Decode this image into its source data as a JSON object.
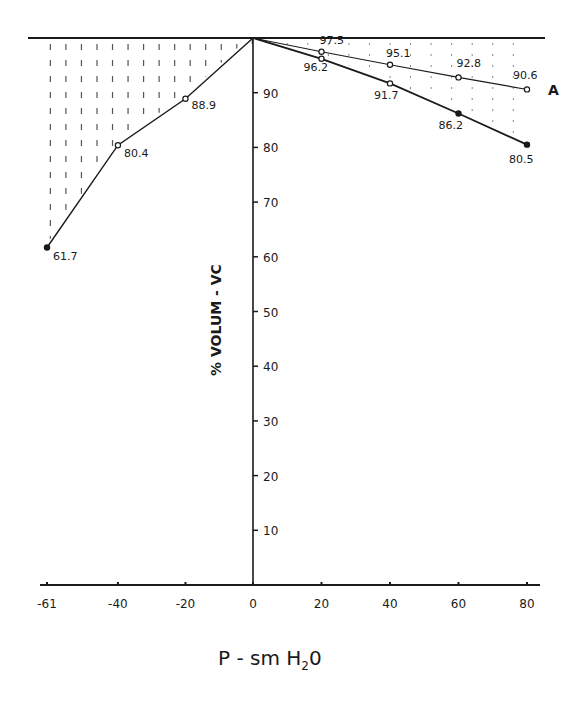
{
  "chart_data": {
    "type": "line",
    "title": "",
    "xlabel": "P - sm H2O",
    "ylabel": "% VOLUM - VC",
    "x_ticks": [
      -61,
      -40,
      -20,
      0,
      20,
      40,
      60,
      80
    ],
    "x_tick_labels": [
      "-61",
      "-40",
      "-20",
      "0",
      "20",
      "40",
      "60",
      "80"
    ],
    "y_ticks": [
      10,
      20,
      30,
      40,
      50,
      60,
      70,
      80,
      90
    ],
    "y_tick_labels": [
      "10",
      "20",
      "30",
      "40",
      "50",
      "60",
      "70",
      "80",
      "90"
    ],
    "xlim": [
      -61,
      80
    ],
    "ylim": [
      0,
      100
    ],
    "grid": false,
    "series": [
      {
        "name": "negative pressure",
        "x": [
          -61,
          -40,
          -20,
          0
        ],
        "y": [
          61.7,
          80.4,
          88.9,
          100
        ],
        "labels": [
          "61.7",
          "80.4",
          "88.9",
          ""
        ],
        "markers": [
          "filled",
          "open",
          "open",
          "none"
        ]
      },
      {
        "name": "A",
        "x": [
          0,
          20,
          40,
          60,
          80
        ],
        "y": [
          100,
          97.5,
          95.1,
          92.8,
          90.6
        ],
        "labels": [
          "",
          "97.5",
          "95.1",
          "92.8",
          "90.6"
        ],
        "markers": [
          "none",
          "open",
          "open",
          "open",
          "open"
        ]
      },
      {
        "name": "positive pressure",
        "x": [
          0,
          20,
          40,
          60,
          80
        ],
        "y": [
          100,
          96.2,
          91.7,
          86.2,
          80.5
        ],
        "labels": [
          "",
          "96.2",
          "91.7",
          "86.2",
          "80.5"
        ],
        "markers": [
          "none",
          "open",
          "open",
          "filled",
          "filled"
        ]
      }
    ],
    "annotations": [
      {
        "text": "A",
        "near": "series A end"
      },
      {
        "text": "hatched region between curves and 100% line"
      }
    ]
  },
  "labels": {
    "xlabel_main": "P - sm H",
    "xlabel_sub": "2",
    "xlabel_tail": "0",
    "ylabel": "% VOLUM - VC",
    "series_tag": "A"
  }
}
